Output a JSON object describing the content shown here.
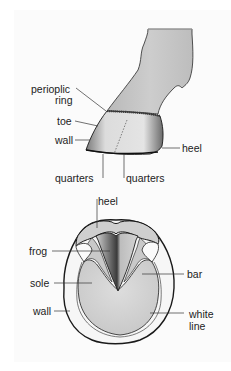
{
  "diagram": {
    "side_view": {
      "labels": [
        {
          "id": "periople-1",
          "text": "perioplic"
        },
        {
          "id": "periople-2",
          "text": "ring"
        },
        {
          "id": "toe",
          "text": "toe"
        },
        {
          "id": "wall",
          "text": "wall"
        },
        {
          "id": "heel",
          "text": "heel"
        },
        {
          "id": "quarters-left",
          "text": "quarters"
        },
        {
          "id": "quarters-right",
          "text": "quarters"
        }
      ]
    },
    "sole_view": {
      "labels": [
        {
          "id": "heel",
          "text": "heel"
        },
        {
          "id": "frog",
          "text": "frog"
        },
        {
          "id": "sole",
          "text": "sole"
        },
        {
          "id": "bar",
          "text": "bar"
        },
        {
          "id": "wall",
          "text": "wall"
        },
        {
          "id": "white-1",
          "text": "white"
        },
        {
          "id": "white-2",
          "text": "line"
        }
      ]
    },
    "colors": {
      "background": "#fbfbfb",
      "hoof_fill": "#d6d6d6",
      "leg_fill": "#c4c4c4",
      "outline": "#1a1a1a"
    }
  }
}
